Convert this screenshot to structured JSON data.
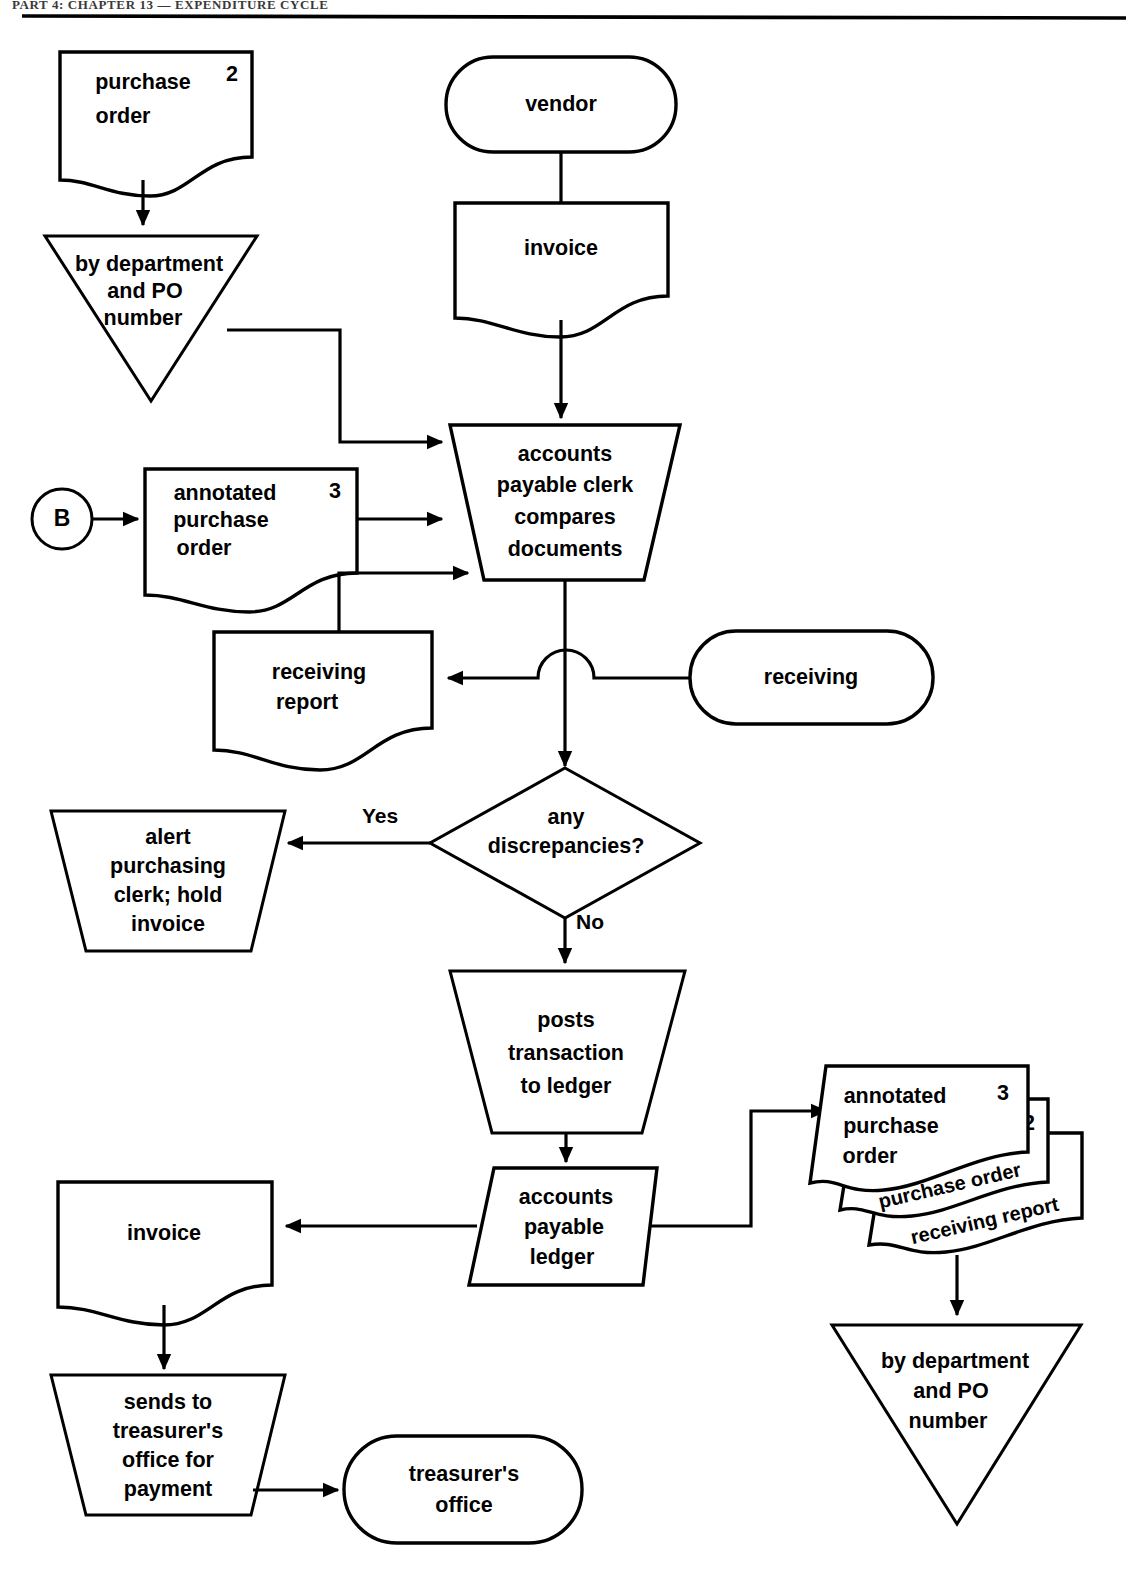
{
  "page": {
    "header_text": "PART 4: CHAPTER 13 — EXPENDITURE CYCLE",
    "width": 1140,
    "height": 1584,
    "bg_color": "#ffffff",
    "line_color": "#000000"
  },
  "diagram": {
    "type": "flowchart",
    "nodes": [
      {
        "id": "po-file-doc",
        "shape": "document",
        "label_lines": [
          "purchase",
          "order"
        ],
        "copy_number": "2"
      },
      {
        "id": "file-left",
        "shape": "triangle-file",
        "label_lines": [
          "by department",
          "and PO",
          "number"
        ]
      },
      {
        "id": "vendor",
        "shape": "terminal",
        "label_lines": [
          "vendor"
        ]
      },
      {
        "id": "invoice-top",
        "shape": "document",
        "label_lines": [
          "invoice"
        ]
      },
      {
        "id": "connector-b",
        "shape": "circle-connector",
        "label_lines": [
          "B"
        ]
      },
      {
        "id": "annotated-po",
        "shape": "document",
        "label_lines": [
          "annotated",
          "purchase",
          "order"
        ],
        "copy_number": "3"
      },
      {
        "id": "ap-clerk-compares",
        "shape": "manual-operation",
        "label_lines": [
          "accounts",
          "payable clerk",
          "compares",
          "documents"
        ]
      },
      {
        "id": "receiving-report",
        "shape": "document",
        "label_lines": [
          "receiving",
          "report"
        ]
      },
      {
        "id": "receiving",
        "shape": "terminal",
        "label_lines": [
          "receiving"
        ]
      },
      {
        "id": "any-discrepancies",
        "shape": "decision",
        "label_lines": [
          "any",
          "discrepancies?"
        ]
      },
      {
        "id": "alert-purchasing",
        "shape": "manual-operation",
        "label_lines": [
          "alert",
          "purchasing",
          "clerk; hold",
          "invoice"
        ]
      },
      {
        "id": "posts-transaction",
        "shape": "manual-operation",
        "label_lines": [
          "posts",
          "transaction",
          "to ledger"
        ]
      },
      {
        "id": "ap-ledger",
        "shape": "parallelogram",
        "label_lines": [
          "accounts",
          "payable",
          "ledger"
        ]
      },
      {
        "id": "invoice-bottom",
        "shape": "document",
        "label_lines": [
          "invoice"
        ]
      },
      {
        "id": "sends-treasurer",
        "shape": "manual-operation",
        "label_lines": [
          "sends to",
          "treasurer's",
          "office for",
          "payment"
        ]
      },
      {
        "id": "treasurers-office",
        "shape": "terminal",
        "label_lines": [
          "treasurer's",
          "office"
        ]
      },
      {
        "id": "doc-stack",
        "shape": "document-stack",
        "label_lines": [
          "annotated",
          "purchase",
          "order"
        ],
        "copy_number": "3",
        "stack_items": [
          {
            "label": "purchase order",
            "copy_number": "2"
          },
          {
            "label": "receiving report",
            "copy_number": ""
          }
        ]
      },
      {
        "id": "file-right",
        "shape": "triangle-file",
        "label_lines": [
          "by department",
          "and PO",
          "number"
        ]
      }
    ],
    "edge_labels": {
      "yes": "Yes",
      "no": "No"
    }
  }
}
